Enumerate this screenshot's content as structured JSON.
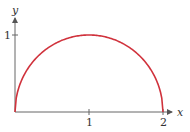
{
  "chart_data": {
    "type": "line",
    "title": "",
    "xlabel": "x",
    "ylabel": "y",
    "x_ticks": [
      "1",
      "2"
    ],
    "y_ticks": [
      "1"
    ],
    "xlim": [
      0,
      2
    ],
    "ylim": [
      0,
      1
    ],
    "grid": false,
    "legend": null,
    "series": [
      {
        "name": "semicircle y = sqrt(1 - (x-1)^2)",
        "color": "#d0323c",
        "x": [
          0,
          0.1,
          0.25,
          0.5,
          0.75,
          1,
          1.25,
          1.5,
          1.75,
          1.9,
          2
        ],
        "y": [
          0,
          0.436,
          0.661,
          0.866,
          0.968,
          1,
          0.968,
          0.866,
          0.661,
          0.436,
          0
        ]
      }
    ]
  },
  "axes": {
    "x_label": "x",
    "y_label": "y",
    "x_tick_1": "1",
    "x_tick_2": "2",
    "y_tick_1": "1"
  },
  "colors": {
    "curve": "#d0323c",
    "axis": "#555555",
    "text": "#333333"
  }
}
